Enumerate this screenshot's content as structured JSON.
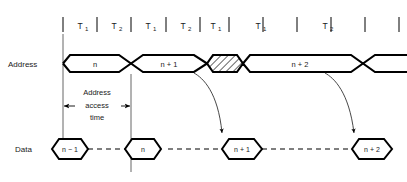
{
  "figure": {
    "type": "timing-diagram",
    "background_color": "#ffffff",
    "line_color": "#000000",
    "text_color": "#1a1a1a"
  },
  "clock_ruler": {
    "tick_positions": [
      63,
      97,
      131,
      166,
      200,
      229,
      263,
      297,
      331,
      365,
      399
    ],
    "intervals": [
      {
        "base": "T",
        "sub": "1"
      },
      {
        "base": "T",
        "sub": "2"
      },
      {
        "base": "T",
        "sub": "1"
      },
      {
        "base": "T",
        "sub": "2"
      },
      {
        "base": "T",
        "sub": "1"
      },
      {
        "base": "T",
        "sub": "1"
      },
      {
        "base": "T",
        "sub": "2"
      }
    ]
  },
  "rows": {
    "address": {
      "label": "Address",
      "segments": [
        {
          "id": "addr-n",
          "value": "n",
          "hatched": false
        },
        {
          "id": "addr-n1",
          "value": "n + 1",
          "hatched": false
        },
        {
          "id": "addr-invalid",
          "value": "",
          "hatched": true
        },
        {
          "id": "addr-n2",
          "value": "n + 2",
          "hatched": false
        }
      ]
    },
    "data": {
      "label": "Data",
      "cells": [
        {
          "id": "data-nm1",
          "value": "n − 1"
        },
        {
          "id": "data-n",
          "value": "n"
        },
        {
          "id": "data-n1",
          "value": "n + 1"
        },
        {
          "id": "data-n2",
          "value": "n + 2"
        }
      ]
    }
  },
  "annotations": {
    "access_time": {
      "lines": [
        "Address",
        "access",
        "time"
      ],
      "arrow_style": "double-headed"
    }
  }
}
